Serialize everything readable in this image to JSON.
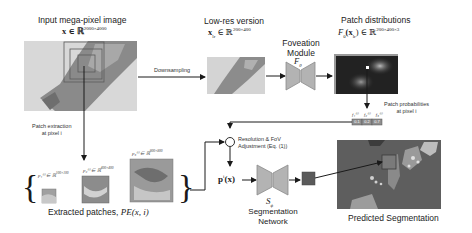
{
  "input_image": {
    "title": "Input mega-pixel image",
    "math": "x ∈ ℝ",
    "dims": "2000×4000"
  },
  "downsampling": {
    "label": "Downsampling"
  },
  "low_res": {
    "title": "Low-res version",
    "math": "x",
    "sub": "lr",
    "math_tail": " ∈ ℝ",
    "dims": "200×400"
  },
  "foveation": {
    "title_line1": "Foveation",
    "title_line2": "Module",
    "symbol": "F",
    "symbol_sub": "θ"
  },
  "patch_distributions": {
    "title": "Patch distributions",
    "math": "F",
    "math_sub": "θ",
    "math_mid": "(x",
    "math_mid_sub": "lr",
    "math_tail": ") ∈ ℝ",
    "dims": "200×400×3"
  },
  "patch_probabilities": {
    "label_line1": "Patch probabilities",
    "label_line2": "at pixel i",
    "values": [
      "0.1",
      "0.2",
      "0.7"
    ],
    "symbols": [
      "f₁⁽ⁱ⁾",
      "f₂⁽ⁱ⁾",
      "f₃⁽ⁱ⁾"
    ]
  },
  "patch_extraction": {
    "label_line1": "Patch extraction",
    "label_line2": "at pixel i"
  },
  "patches": [
    {
      "symbol": "p₁⁽ⁱ⁾ ∈ ℝ",
      "dims": "100×100"
    },
    {
      "symbol": "p₂⁽ⁱ⁾ ∈ ℝ",
      "dims": "400×400"
    },
    {
      "symbol": "p₃⁽ⁱ⁾ ∈ ℝ",
      "dims": "800×800"
    }
  ],
  "extracted_patches": {
    "label": "Extracted patches, ",
    "math": "PE(x, i)"
  },
  "adjustment": {
    "label_line1": "Resolution & FoV",
    "label_line2": "Adjustment (Eq. (1))"
  },
  "p_of_x": {
    "math": "p",
    "sup": "i",
    "tail": "(x)"
  },
  "segmentation_network": {
    "symbol": "S",
    "symbol_sub": "ϕ",
    "label_line1": "Segmentation",
    "label_line2": "Network"
  },
  "predicted_segmentation": {
    "label": "Predicted Segmentation"
  },
  "colors": {
    "arrow": "#1a1a1a",
    "network_fill": "#b3b3b3",
    "network_stroke": "#8a8a8a",
    "tissue_dark": "#7a7a7a",
    "tissue_light": "#cfcfcf",
    "heatmap_bg": "#222222",
    "seg_bg": "#5e5e5e",
    "crop_box": "#666666"
  }
}
